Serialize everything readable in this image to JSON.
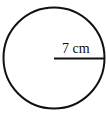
{
  "diagram": {
    "shape": "circle",
    "radius_label": "7 cm",
    "stroke_color": "#111111",
    "background": "#ffffff"
  }
}
